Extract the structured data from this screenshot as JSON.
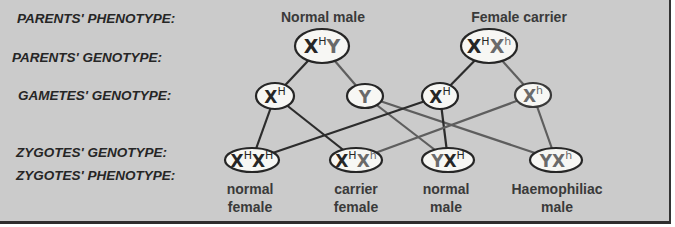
{
  "colors": {
    "background": "#cbcbcb",
    "border": "#2e2e2e",
    "dominant_allele": "#262626",
    "recessive_allele": "#6a6a6a",
    "node_fill": "#f7f7f4"
  },
  "row_labels": {
    "parents_phenotype": "PARENTS' PHENOTYPE:",
    "parents_genotype": "PARENTS' GENOTYPE:",
    "gametes_genotype": "GAMETES' GENOTYPE:",
    "zygotes_genotype": "ZYGOTES' GENOTYPE:",
    "zygotes_phenotype": "ZYGOTES' PHENOTYPE:"
  },
  "parents": {
    "male": {
      "phenotype": "Normal male",
      "alleles": [
        {
          "base": "X",
          "sup": "H",
          "tone": "dark"
        },
        {
          "base": "Y",
          "sup": "",
          "tone": "gray"
        }
      ]
    },
    "female": {
      "phenotype": "Female carrier",
      "alleles": [
        {
          "base": "X",
          "sup": "H",
          "tone": "dark"
        },
        {
          "base": "X",
          "sup": "h",
          "tone": "gray"
        }
      ]
    }
  },
  "gametes": [
    {
      "from": "male",
      "base": "X",
      "sup": "H",
      "tone": "dark"
    },
    {
      "from": "male",
      "base": "Y",
      "sup": "",
      "tone": "gray"
    },
    {
      "from": "female",
      "base": "X",
      "sup": "H",
      "tone": "dark"
    },
    {
      "from": "female",
      "base": "X",
      "sup": "h",
      "tone": "gray"
    }
  ],
  "zygotes": [
    {
      "alleles": [
        {
          "base": "X",
          "sup": "H",
          "tone": "dark"
        },
        {
          "base": "X",
          "sup": "H",
          "tone": "dark"
        }
      ],
      "phenotype_line1": "normal",
      "phenotype_line2": "female"
    },
    {
      "alleles": [
        {
          "base": "X",
          "sup": "H",
          "tone": "dark"
        },
        {
          "base": "X",
          "sup": "h",
          "tone": "gray"
        }
      ],
      "phenotype_line1": "carrier",
      "phenotype_line2": "female"
    },
    {
      "alleles": [
        {
          "base": "Y",
          "sup": "",
          "tone": "gray"
        },
        {
          "base": "X",
          "sup": "H",
          "tone": "dark"
        }
      ],
      "phenotype_line1": "normal",
      "phenotype_line2": "male"
    },
    {
      "alleles": [
        {
          "base": "Y",
          "sup": "",
          "tone": "gray"
        },
        {
          "base": "X",
          "sup": "h",
          "tone": "gray"
        }
      ],
      "phenotype_line1": "Haemophiliac",
      "phenotype_line2": "male"
    }
  ],
  "connections": [
    {
      "from": "parent-male",
      "to": "gamete-male-XH",
      "style": "dark"
    },
    {
      "from": "parent-male",
      "to": "gamete-male-Y",
      "style": "gray"
    },
    {
      "from": "parent-female",
      "to": "gamete-female-XH",
      "style": "dark"
    },
    {
      "from": "parent-female",
      "to": "gamete-female-Xh",
      "style": "gray"
    },
    {
      "from": "gamete-male-XH",
      "to": "zygote-XHXH",
      "style": "dark"
    },
    {
      "from": "gamete-male-XH",
      "to": "zygote-XHXh",
      "style": "dark"
    },
    {
      "from": "gamete-male-Y",
      "to": "zygote-YXH",
      "style": "gray"
    },
    {
      "from": "gamete-male-Y",
      "to": "zygote-YXh",
      "style": "gray"
    },
    {
      "from": "gamete-female-XH",
      "to": "zygote-XHXH",
      "style": "dark"
    },
    {
      "from": "gamete-female-XH",
      "to": "zygote-YXH",
      "style": "dark"
    },
    {
      "from": "gamete-female-Xh",
      "to": "zygote-XHXh",
      "style": "gray"
    },
    {
      "from": "gamete-female-Xh",
      "to": "zygote-YXh",
      "style": "gray"
    }
  ]
}
